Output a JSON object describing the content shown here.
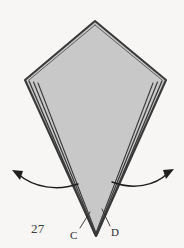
{
  "figure": {
    "kind": "origami-fold-diagram",
    "step_number": "27",
    "background_color": "#f7f6f4",
    "paper_fill_color": "#c8c8c8",
    "outline_color": "#3a3a3a",
    "arrow_color": "#1f1f1f",
    "label_color": "#2e2e2e"
  },
  "labels": {
    "step": "27",
    "point_c": "C",
    "point_d": "D"
  },
  "shape": {
    "name": "kite",
    "vertices": {
      "top": [
        95,
        21
      ],
      "left": [
        25,
        80
      ],
      "right": [
        166,
        80
      ],
      "bottom": [
        96,
        236
      ]
    },
    "layer_line_count": 3
  },
  "arrows": [
    {
      "name": "left-fold-arrow",
      "direction": "outward-left",
      "tail": [
        78,
        184
      ],
      "head": [
        14,
        173
      ]
    },
    {
      "name": "right-fold-arrow",
      "direction": "outward-right",
      "tail": [
        112,
        182
      ],
      "head": [
        172,
        172
      ]
    }
  ],
  "leaders": [
    {
      "name": "leader-c",
      "from": [
        80,
        228
      ],
      "to": [
        89,
        213
      ]
    },
    {
      "name": "leader-d",
      "from": [
        110,
        226
      ],
      "to": [
        103,
        210
      ]
    }
  ]
}
